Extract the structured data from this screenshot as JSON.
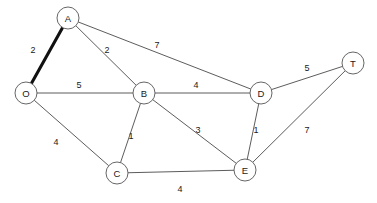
{
  "diagram": {
    "width": 377,
    "height": 203,
    "background_color": "#ffffff",
    "node_fill_color": "#ffffff",
    "node_stroke_color": "#555555",
    "edge_color": "#4a4a4a",
    "highlight_color": "#111111",
    "label_color": "#1a1a1a",
    "node_radius": 11
  },
  "nodes": [
    {
      "id": "A",
      "label": "A",
      "x": 68,
      "y": 18
    },
    {
      "id": "O",
      "label": "O",
      "x": 26,
      "y": 93
    },
    {
      "id": "B",
      "label": "B",
      "x": 144,
      "y": 93
    },
    {
      "id": "D",
      "label": "D",
      "x": 261,
      "y": 93
    },
    {
      "id": "T",
      "label": "T",
      "x": 353,
      "y": 63
    },
    {
      "id": "C",
      "label": "C",
      "x": 117,
      "y": 173
    },
    {
      "id": "E",
      "label": "E",
      "x": 245,
      "y": 170
    }
  ],
  "edges": [
    {
      "id": "O-A",
      "from": "O",
      "to": "A",
      "weight": "2",
      "label_x": 33,
      "label_y": 50,
      "highlighted": true
    },
    {
      "id": "A-B",
      "from": "A",
      "to": "B",
      "weight": "2",
      "label_x": 107,
      "label_y": 50,
      "highlighted": false
    },
    {
      "id": "A-D",
      "from": "A",
      "to": "D",
      "weight": "7",
      "label_x": 157,
      "label_y": 45,
      "highlighted": false
    },
    {
      "id": "O-B",
      "from": "O",
      "to": "B",
      "weight": "5",
      "label_x": 79,
      "label_y": 85,
      "highlighted": false
    },
    {
      "id": "B-D",
      "from": "B",
      "to": "D",
      "weight": "4",
      "label_x": 196,
      "label_y": 85,
      "highlighted": false
    },
    {
      "id": "D-T",
      "from": "D",
      "to": "T",
      "weight": "5",
      "label_x": 307,
      "label_y": 68,
      "highlighted": false
    },
    {
      "id": "O-C",
      "from": "O",
      "to": "C",
      "weight": "4",
      "label_x": 56,
      "label_y": 142,
      "highlighted": false
    },
    {
      "id": "B-C",
      "from": "B",
      "to": "C",
      "weight": "1",
      "label_x": 131,
      "label_y": 136,
      "highlighted": false
    },
    {
      "id": "B-E",
      "from": "B",
      "to": "E",
      "weight": "3",
      "label_x": 198,
      "label_y": 130,
      "highlighted": false
    },
    {
      "id": "D-E",
      "from": "D",
      "to": "E",
      "weight": "1",
      "label_x": 256,
      "label_y": 130,
      "highlighted": false
    },
    {
      "id": "E-T",
      "from": "E",
      "to": "T",
      "weight": "7",
      "label_x": 307,
      "label_y": 130,
      "highlighted": false
    },
    {
      "id": "C-E",
      "from": "C",
      "to": "E",
      "weight": "4",
      "label_x": 180,
      "label_y": 189,
      "highlighted": false
    }
  ],
  "chart_data": {
    "type": "diagram",
    "graph_type": "weighted-undirected-graph",
    "node_ids": [
      "O",
      "A",
      "B",
      "C",
      "D",
      "E",
      "T"
    ],
    "edge_list": [
      {
        "endpoints": [
          "O",
          "A"
        ],
        "weight": 2
      },
      {
        "endpoints": [
          "O",
          "B"
        ],
        "weight": 5
      },
      {
        "endpoints": [
          "O",
          "C"
        ],
        "weight": 4
      },
      {
        "endpoints": [
          "A",
          "B"
        ],
        "weight": 2
      },
      {
        "endpoints": [
          "A",
          "D"
        ],
        "weight": 7
      },
      {
        "endpoints": [
          "B",
          "C"
        ],
        "weight": 1
      },
      {
        "endpoints": [
          "B",
          "D"
        ],
        "weight": 4
      },
      {
        "endpoints": [
          "B",
          "E"
        ],
        "weight": 3
      },
      {
        "endpoints": [
          "C",
          "E"
        ],
        "weight": 4
      },
      {
        "endpoints": [
          "D",
          "E"
        ],
        "weight": 1
      },
      {
        "endpoints": [
          "D",
          "T"
        ],
        "weight": 5
      },
      {
        "endpoints": [
          "E",
          "T"
        ],
        "weight": 7
      }
    ],
    "highlighted_edges": [
      [
        "O",
        "A"
      ]
    ]
  }
}
